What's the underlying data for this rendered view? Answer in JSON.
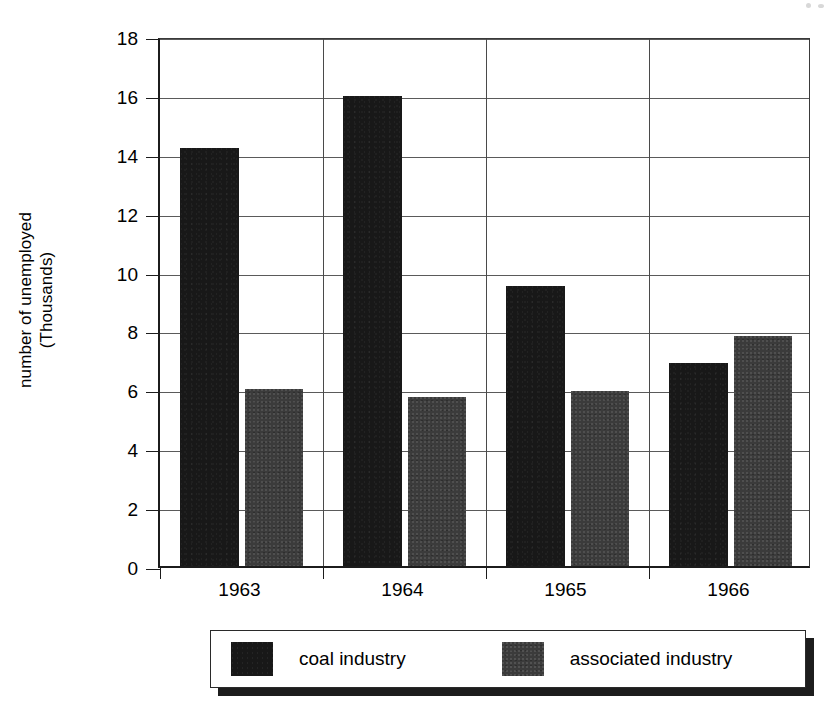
{
  "chart_data": {
    "type": "bar",
    "title": "",
    "xlabel": "",
    "ylabel": "number of unemployed (Thousands)",
    "ylabel_line1": "number of unemployed",
    "ylabel_line2": "(Thousands)",
    "categories": [
      "1963",
      "1964",
      "1965",
      "1966"
    ],
    "series": [
      {
        "name": "coal industry",
        "values": [
          14.2,
          15.95,
          9.5,
          6.9
        ],
        "color": "#181818"
      },
      {
        "name": "associated industry",
        "values": [
          6.0,
          5.75,
          5.95,
          7.8
        ],
        "color": "#3b3b3b"
      }
    ],
    "ylim": [
      0,
      18
    ],
    "ytick_values": [
      0,
      2,
      4,
      6,
      8,
      10,
      12,
      14,
      16,
      18
    ],
    "ytick_labels": [
      "0",
      "2",
      "4",
      "6",
      "8",
      "10",
      "12",
      "14",
      "16",
      "18"
    ],
    "grid": true,
    "grid_axis": "y",
    "legend_position": "bottom"
  },
  "legend": {
    "items": [
      {
        "label": "coal industry",
        "swatch": "coal-swatch"
      },
      {
        "label": "associated industry",
        "swatch": "associated-swatch"
      }
    ]
  }
}
